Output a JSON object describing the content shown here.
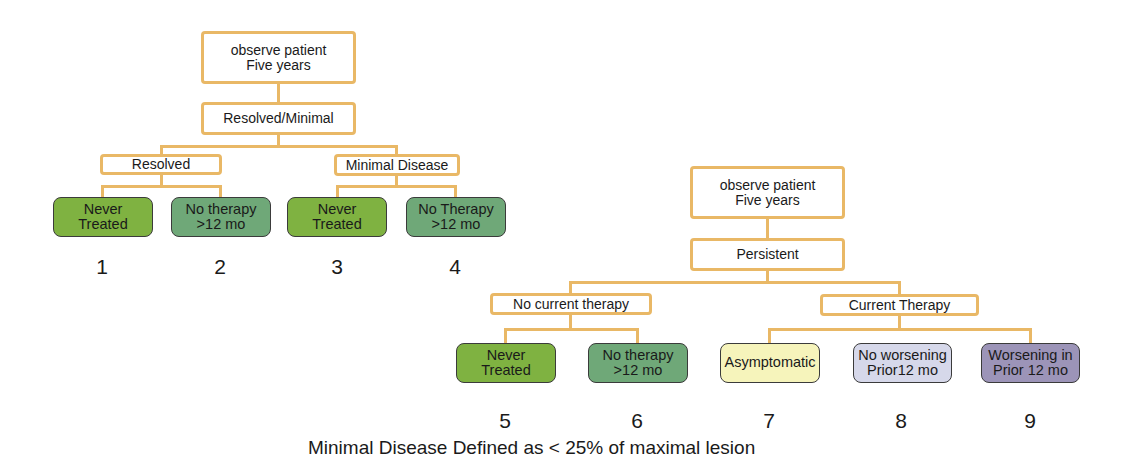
{
  "colors": {
    "connector": "#e9b866",
    "never_treated": "#7fb241",
    "no_therapy": "#6fa878",
    "asymptomatic": "#f6f4bb",
    "no_worsening": "#d6d8ea",
    "worsening": "#9c94b8"
  },
  "left_tree": {
    "root": "observe patient\nFive years",
    "branch": "Resolved/Minimal",
    "groups": [
      {
        "label": "Resolved",
        "leaves": [
          {
            "label": "Never\nTreated",
            "number": "1"
          },
          {
            "label": "No therapy\n>12 mo",
            "number": "2"
          }
        ]
      },
      {
        "label": "Minimal Disease",
        "leaves": [
          {
            "label": "Never\nTreated",
            "number": "3"
          },
          {
            "label": "No Therapy\n>12 mo",
            "number": "4"
          }
        ]
      }
    ]
  },
  "right_tree": {
    "root": "observe patient\nFive years",
    "branch": "Persistent",
    "groups": [
      {
        "label": "No current therapy",
        "leaves": [
          {
            "label": "Never\nTreated",
            "number": "5"
          },
          {
            "label": "No therapy\n>12 mo",
            "number": "6"
          }
        ]
      },
      {
        "label": "Current Therapy",
        "leaves": [
          {
            "label": "Asymptomatic",
            "number": "7"
          },
          {
            "label": "No worsening\nPrior12 mo",
            "number": "8"
          },
          {
            "label": "Worsening in\nPrior 12 mo",
            "number": "9"
          }
        ]
      }
    ]
  },
  "caption": "Minimal Disease Defined as < 25% of maximal lesion"
}
